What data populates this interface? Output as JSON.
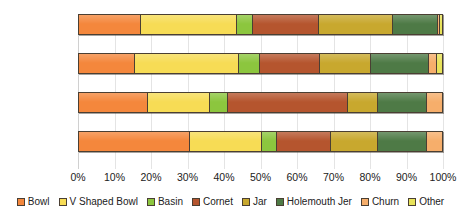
{
  "chart_data": {
    "type": "bar",
    "orientation": "horizontal",
    "stacked": true,
    "normalized_percent": true,
    "title": "",
    "xlabel": "",
    "ylabel": "",
    "xlim": [
      0,
      100
    ],
    "grid": true,
    "legend_position": "bottom",
    "categories": [
      "J (n=526)",
      "I (n=1140)",
      "C (n=3925)",
      "A (n=3005)"
    ],
    "x_tick_labels": [
      "0%",
      "10%",
      "20%",
      "30%",
      "40%",
      "50%",
      "60%",
      "70%",
      "80%",
      "90%",
      "100%"
    ],
    "x_tick_values": [
      0,
      10,
      20,
      30,
      40,
      50,
      60,
      70,
      80,
      90,
      100
    ],
    "series": [
      {
        "name": "Bowl",
        "color": "#F4873C",
        "values": [
          17.0,
          15.5,
          19.0,
          30.5
        ]
      },
      {
        "name": "V Shaped Bowl",
        "color": "#F7DC55",
        "values": [
          26.5,
          28.5,
          17.0,
          20.0
        ]
      },
      {
        "name": "Basin",
        "color": "#8CC63E",
        "values": [
          4.5,
          6.0,
          5.0,
          4.0
        ]
      },
      {
        "name": "Cornet",
        "color": "#B5552E",
        "values": [
          18.0,
          16.5,
          33.0,
          15.0
        ]
      },
      {
        "name": "Jar",
        "color": "#C8A82E",
        "values": [
          20.5,
          14.0,
          8.5,
          13.0
        ]
      },
      {
        "name": "Holemouth Jer",
        "color": "#4E7A46",
        "values": [
          12.5,
          16.0,
          13.5,
          13.5
        ]
      },
      {
        "name": "Churn",
        "color": "#F6AE6B",
        "values": [
          0.5,
          2.0,
          4.0,
          4.0
        ]
      },
      {
        "name": "Other",
        "color": "#E8E35A",
        "values": [
          0.5,
          1.5,
          0.0,
          0.0
        ]
      }
    ]
  },
  "legend": {
    "items": [
      {
        "label": "Bowl",
        "color": "#F4873C"
      },
      {
        "label": "V Shaped Bowl",
        "color": "#F7DC55"
      },
      {
        "label": "Basin",
        "color": "#8CC63E"
      },
      {
        "label": "Cornet",
        "color": "#B5552E"
      },
      {
        "label": "Jar",
        "color": "#C8A82E"
      },
      {
        "label": "Holemouth Jer",
        "color": "#4E7A46"
      },
      {
        "label": "Churn",
        "color": "#F6AE6B"
      },
      {
        "label": "Other",
        "color": "#E8E35A"
      }
    ]
  }
}
